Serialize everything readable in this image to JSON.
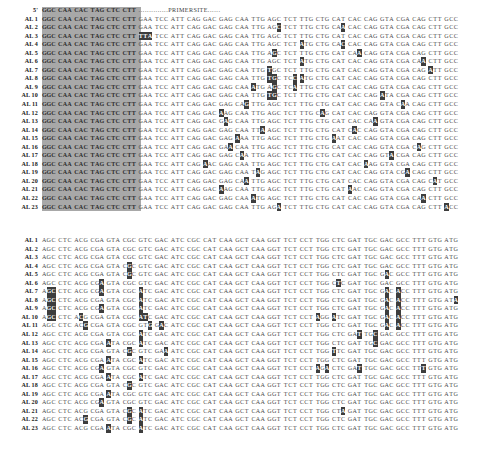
{
  "figure": {
    "type": "multiple-sequence-alignment",
    "blocks": [
      {
        "id": "top-block",
        "name": "upstream-alignment-block",
        "header": {
          "label": "5'",
          "shaded_codons": [
            "GGC",
            "CAA",
            "CAC",
            "TAG",
            "CTC",
            "CTT"
          ],
          "annotation_dots_left": "..............",
          "annotation_text": "PRIMERSITE",
          "annotation_dots_right": "......"
        },
        "consensus": [
          "GGC",
          "CAA",
          "CAC",
          "TAG",
          "CTC",
          "CTT",
          "GAA",
          "TCC",
          "ATT",
          "CAG",
          "GAC",
          "GAG",
          "CAA",
          "TTG",
          "AGC",
          "TCT",
          "TTG",
          "CTG",
          "CAT",
          "CAC",
          "CAG",
          "GTA",
          "CGA",
          "CAG",
          "CTT",
          "GCC"
        ],
        "shaded_columns": [
          0,
          1,
          2,
          3,
          4,
          5
        ],
        "rows": [
          {
            "label": "AL  1",
            "variants": []
          },
          {
            "label": "AL  2",
            "variants": [
              {
                "c": 14,
                "p": 2,
                "b": "C"
              },
              {
                "c": 18,
                "p": 2,
                "b": "A"
              }
            ]
          },
          {
            "label": "AL  3",
            "variants": [
              {
                "c": 6,
                "p": 0,
                "b": "T"
              },
              {
                "c": 6,
                "p": 1,
                "b": "T"
              },
              {
                "c": 6,
                "p": 2,
                "b": "A"
              }
            ]
          },
          {
            "label": "AL  4",
            "variants": [
              {
                "c": 16,
                "p": 0,
                "b": "A"
              },
              {
                "c": 18,
                "p": 2,
                "b": "C"
              }
            ]
          },
          {
            "label": "AL  5",
            "variants": [
              {
                "c": 14,
                "p": 1,
                "b": "G"
              },
              {
                "c": 19,
                "p": 2,
                "b": "A"
              }
            ]
          },
          {
            "label": "AL  6",
            "variants": [
              {
                "c": 16,
                "p": 0,
                "b": "A"
              },
              {
                "c": 23,
                "p": 2,
                "b": "A"
              }
            ]
          },
          {
            "label": "AL  7",
            "variants": [
              {
                "c": 14,
                "p": 0,
                "b": "T"
              },
              {
                "c": 24,
                "p": 0,
                "b": "A"
              }
            ]
          },
          {
            "label": "AL  8",
            "variants": [
              {
                "c": 14,
                "p": 0,
                "b": "T"
              },
              {
                "c": 14,
                "p": 1,
                "b": "G"
              },
              {
                "c": 15,
                "p": 2,
                "b": "C"
              },
              {
                "c": 16,
                "p": 0,
                "b": "A"
              }
            ]
          },
          {
            "label": "AL  9",
            "variants": [
              {
                "c": 13,
                "p": 0,
                "b": "A"
              },
              {
                "c": 14,
                "p": 1,
                "b": "G"
              },
              {
                "c": 15,
                "p": 2,
                "b": "A"
              }
            ]
          },
          {
            "label": "AL 10",
            "variants": [
              {
                "c": 14,
                "p": 0,
                "b": "T"
              },
              {
                "c": 14,
                "p": 1,
                "b": "G"
              },
              {
                "c": 21,
                "p": 0,
                "b": "A"
              }
            ]
          },
          {
            "label": "AL 11",
            "variants": [
              {
                "c": 12,
                "p": 2,
                "b": "G"
              },
              {
                "c": 22,
                "p": 1,
                "b": "A"
              }
            ]
          },
          {
            "label": "AL 12",
            "variants": [
              {
                "c": 11,
                "p": 0,
                "b": "A"
              },
              {
                "c": 17,
                "p": 1,
                "b": "A"
              }
            ]
          },
          {
            "label": "AL 13",
            "variants": [
              {
                "c": 11,
                "p": 1,
                "b": "A"
              },
              {
                "c": 20,
                "p": 2,
                "b": "A"
              }
            ]
          },
          {
            "label": "AL 14",
            "variants": [
              {
                "c": 13,
                "p": 2,
                "b": "A"
              },
              {
                "c": 19,
                "p": 1,
                "b": "A"
              }
            ]
          },
          {
            "label": "AL 15",
            "variants": [
              {
                "c": 12,
                "p": 0,
                "b": "A"
              },
              {
                "c": 18,
                "p": 0,
                "b": "A"
              }
            ]
          },
          {
            "label": "AL 16",
            "variants": [
              {
                "c": 11,
                "p": 2,
                "b": "A"
              },
              {
                "c": 23,
                "p": 1,
                "b": "A"
              }
            ]
          },
          {
            "label": "AL 17",
            "variants": [
              {
                "c": 12,
                "p": 1,
                "b": "A"
              },
              {
                "c": 21,
                "p": 2,
                "b": "A"
              }
            ]
          },
          {
            "label": "AL 18",
            "variants": [
              {
                "c": 10,
                "p": 0,
                "b": "A"
              },
              {
                "c": 20,
                "p": 0,
                "b": "A"
              }
            ]
          },
          {
            "label": "AL 19",
            "variants": [
              {
                "c": 13,
                "p": 1,
                "b": "A"
              },
              {
                "c": 22,
                "p": 2,
                "b": "A"
              }
            ]
          },
          {
            "label": "AL 20",
            "variants": [
              {
                "c": 12,
                "p": 2,
                "b": "A"
              },
              {
                "c": 24,
                "p": 1,
                "b": "A"
              }
            ]
          },
          {
            "label": "AL 21",
            "variants": [
              {
                "c": 11,
                "p": 0,
                "b": "A"
              },
              {
                "c": 19,
                "p": 0,
                "b": "A"
              }
            ]
          },
          {
            "label": "AL 22",
            "variants": [
              {
                "c": 13,
                "p": 0,
                "b": "A"
              },
              {
                "c": 23,
                "p": 2,
                "b": "A"
              }
            ]
          },
          {
            "label": "AL 23",
            "variants": [
              {
                "c": 14,
                "p": 2,
                "b": "A"
              },
              {
                "c": 25,
                "p": 0,
                "b": "A"
              }
            ]
          }
        ]
      },
      {
        "id": "bottom-block",
        "name": "downstream-alignment-block",
        "consensus": [
          "AGC",
          "CTC",
          "ACG",
          "CGA",
          "GTA",
          "CGC",
          "GTC",
          "GAC",
          "ATC",
          "CGC",
          "CAT",
          "CAA",
          "GCT",
          "CAA",
          "GGT",
          "TCT",
          "CCT",
          "TGG",
          "CTC",
          "GAT",
          "TGC",
          "GAC",
          "GCC",
          "TTT",
          "GTG",
          "ATG"
        ],
        "shaded_columns": [],
        "rows": [
          {
            "label": "AL  1",
            "variants": []
          },
          {
            "label": "AL  2",
            "variants": []
          },
          {
            "label": "AL  3",
            "variants": []
          },
          {
            "label": "AL  4",
            "variants": [
              {
                "c": 5,
                "p": 1,
                "b": "G"
              }
            ]
          },
          {
            "label": "AL  5",
            "variants": [
              {
                "c": 5,
                "p": 1,
                "b": "G"
              },
              {
                "c": 21,
                "p": 1,
                "b": "A"
              }
            ]
          },
          {
            "label": "AL  6",
            "variants": [
              {
                "c": 3,
                "p": 2,
                "b": "A"
              },
              {
                "c": 18,
                "p": 1,
                "b": "T"
              }
            ]
          },
          {
            "label": "AL  7",
            "variants": [
              {
                "c": 0,
                "p": 1,
                "b": "G"
              },
              {
                "c": 0,
                "p": 2,
                "b": "C"
              },
              {
                "c": 3,
                "p": 2,
                "b": "A"
              },
              {
                "c": 6,
                "p": 0,
                "b": "A"
              },
              {
                "c": 21,
                "p": 1,
                "b": "A"
              },
              {
                "c": 22,
                "p": 0,
                "b": "A"
              }
            ]
          },
          {
            "label": "AL  8",
            "variants": [
              {
                "c": 0,
                "p": 1,
                "b": "G"
              },
              {
                "c": 0,
                "p": 2,
                "b": "C"
              },
              {
                "c": 6,
                "p": 0,
                "b": "A"
              },
              {
                "c": 21,
                "p": 1,
                "b": "A"
              },
              {
                "c": 22,
                "p": 0,
                "b": "A"
              },
              {
                "c": 25,
                "p": 2,
                "b": "A"
              }
            ]
          },
          {
            "label": "AL  9",
            "variants": [
              {
                "c": 0,
                "p": 1,
                "b": "G"
              },
              {
                "c": 0,
                "p": 2,
                "b": "C"
              },
              {
                "c": 3,
                "p": 2,
                "b": "A"
              },
              {
                "c": 6,
                "p": 0,
                "b": "A"
              },
              {
                "c": 21,
                "p": 1,
                "b": "A"
              },
              {
                "c": 22,
                "p": 0,
                "b": "A"
              }
            ]
          },
          {
            "label": "AL 10",
            "variants": [
              {
                "c": 0,
                "p": 1,
                "b": "G"
              },
              {
                "c": 0,
                "p": 2,
                "b": "C"
              },
              {
                "c": 2,
                "p": 1,
                "b": "C"
              },
              {
                "c": 6,
                "p": 0,
                "b": "A"
              },
              {
                "c": 6,
                "p": 1,
                "b": "T"
              },
              {
                "c": 17,
                "p": 0,
                "b": "A"
              },
              {
                "c": 18,
                "p": 0,
                "b": "A"
              },
              {
                "c": 21,
                "p": 1,
                "b": "A"
              },
              {
                "c": 22,
                "p": 0,
                "b": "A"
              }
            ]
          },
          {
            "label": "AL 11",
            "variants": [
              {
                "c": 2,
                "p": 2,
                "b": "G"
              },
              {
                "c": 6,
                "p": 2,
                "b": "G"
              },
              {
                "c": 7,
                "p": 1,
                "b": "A"
              },
              {
                "c": 21,
                "p": 1,
                "b": "A"
              },
              {
                "c": 22,
                "p": 0,
                "b": "A"
              }
            ]
          },
          {
            "label": "AL 12",
            "variants": [
              {
                "c": 6,
                "p": 0,
                "b": "A"
              },
              {
                "c": 19,
                "p": 2,
                "b": "T"
              },
              {
                "c": 20,
                "p": 2,
                "b": "C"
              }
            ]
          },
          {
            "label": "AL 13",
            "variants": [
              {
                "c": 4,
                "p": 0,
                "b": "A"
              },
              {
                "c": 6,
                "p": 0,
                "b": "A"
              },
              {
                "c": 20,
                "p": 2,
                "b": "C"
              }
            ]
          },
          {
            "label": "AL 14",
            "variants": [
              {
                "c": 5,
                "p": 1,
                "b": "G"
              },
              {
                "c": 7,
                "p": 2,
                "b": "A"
              },
              {
                "c": 18,
                "p": 0,
                "b": "T"
              }
            ]
          },
          {
            "label": "AL 15",
            "variants": [
              {
                "c": 4,
                "p": 0,
                "b": "A"
              },
              {
                "c": 6,
                "p": 0,
                "b": "A"
              }
            ]
          },
          {
            "label": "AL 16",
            "variants": [
              {
                "c": 3,
                "p": 2,
                "b": "A"
              },
              {
                "c": 17,
                "p": 0,
                "b": "A"
              },
              {
                "c": 17,
                "p": 2,
                "b": "A"
              },
              {
                "c": 19,
                "p": 2,
                "b": "T"
              },
              {
                "c": 23,
                "p": 2,
                "b": "T"
              }
            ]
          },
          {
            "label": "AL 17",
            "variants": [
              {
                "c": 4,
                "p": 0,
                "b": "A"
              },
              {
                "c": 6,
                "p": 0,
                "b": "A"
              }
            ]
          },
          {
            "label": "AL 18",
            "variants": [
              {
                "c": 5,
                "p": 1,
                "b": "G"
              }
            ]
          },
          {
            "label": "AL 19",
            "variants": [
              {
                "c": 4,
                "p": 0,
                "b": "A"
              }
            ]
          },
          {
            "label": "AL 20",
            "variants": [
              {
                "c": 3,
                "p": 2,
                "b": "A"
              }
            ]
          },
          {
            "label": "AL 21",
            "variants": [
              {
                "c": 5,
                "p": 1,
                "b": "G"
              },
              {
                "c": 6,
                "p": 0,
                "b": "A"
              },
              {
                "c": 18,
                "p": 2,
                "b": "A"
              }
            ]
          },
          {
            "label": "AL 22",
            "variants": [
              {
                "c": 2,
                "p": 2,
                "b": "G"
              },
              {
                "c": 5,
                "p": 1,
                "b": "G"
              },
              {
                "c": 6,
                "p": 0,
                "b": "A"
              }
            ]
          },
          {
            "label": "AL 23",
            "variants": [
              {
                "c": 4,
                "p": 0,
                "b": "A"
              },
              {
                "c": 6,
                "p": 0,
                "b": "A"
              }
            ]
          }
        ]
      }
    ]
  },
  "colors": {
    "shade_background": "#a8a8a8",
    "highlight_background": "#3d3d3d",
    "text": "#3a3a3a",
    "page_background": "#ffffff"
  }
}
